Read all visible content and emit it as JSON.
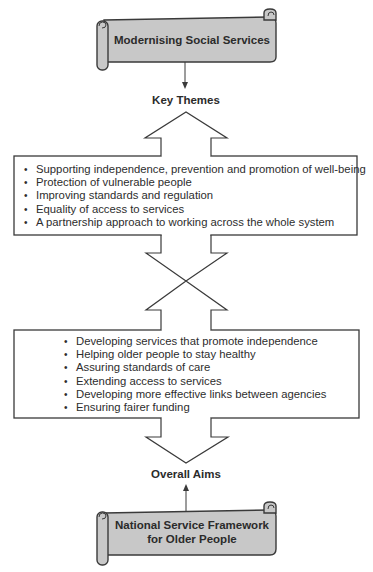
{
  "diagram": {
    "top_scroll": {
      "title": "Modernising Social Services"
    },
    "key_themes": {
      "label": "Key Themes",
      "items": [
        "Supporting independence, prevention and promotion of well-being",
        "Protection of vulnerable people",
        "Improving standards and regulation",
        "Equality of access to services",
        "A partnership approach to working across the whole system"
      ]
    },
    "overall_aims": {
      "label": "Overall Aims",
      "items": [
        "Developing services that promote independence",
        "Helping older people to stay healthy",
        "Assuring standards of care",
        "Extending access to services",
        "Developing more effective links between agencies",
        "Ensuring fairer funding"
      ]
    },
    "bottom_scroll": {
      "title_line1": "National Service Framework",
      "title_line2": "for Older People"
    },
    "bullet_glyph": "•",
    "colors": {
      "scroll_fill": "#c8c8c8",
      "stroke": "#3a3a3a",
      "box_fill": "#ffffff"
    }
  }
}
